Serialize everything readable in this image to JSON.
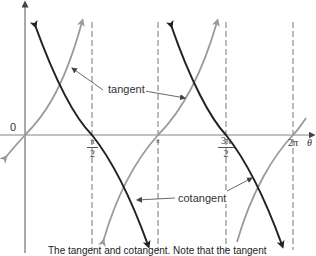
{
  "figure": {
    "type": "diagram",
    "axes": {
      "origin_label": "0",
      "x_axis_label": "θ",
      "x_ticks": [
        {
          "label_num": "π",
          "label_den": "2",
          "value": "π/2"
        },
        {
          "label": "π",
          "value": "π"
        },
        {
          "label_num": "3π",
          "label_den": "2",
          "value": "3π/2"
        },
        {
          "label": "2π",
          "value": "2π"
        }
      ]
    },
    "annotations": {
      "tangent": "tangent",
      "cotangent": "cotangent"
    },
    "caption": "The tangent and cotangent. Note that the tangent"
  },
  "colors": {
    "tangent_curve": "#9a9a9a",
    "cotangent_curve": "#222222",
    "axis": "#555555",
    "asymptote": "#777777",
    "background": "#ffffff"
  }
}
